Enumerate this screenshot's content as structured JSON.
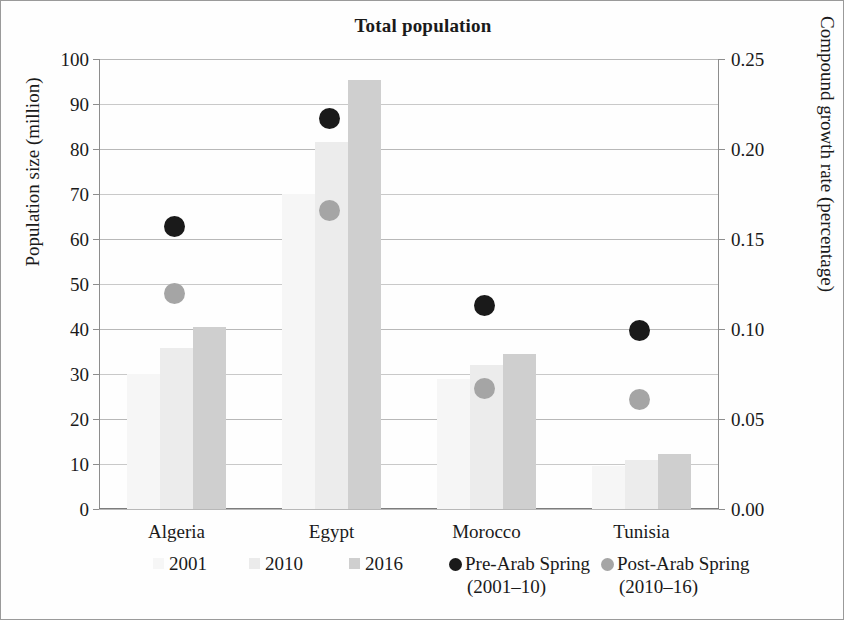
{
  "chart_data": {
    "type": "bar",
    "title": "Total population",
    "categories": [
      "Algeria",
      "Egypt",
      "Morocco",
      "Tunisia"
    ],
    "xlabel": "",
    "ylabel": "Population size (million)",
    "ylabel_right": "Compound growth rate (percentage)",
    "ylim": [
      0,
      100
    ],
    "ylim_right": [
      0.0,
      0.25
    ],
    "yticks": [
      "0",
      "10",
      "20",
      "30",
      "40",
      "50",
      "60",
      "70",
      "80",
      "90",
      "100"
    ],
    "yticks_right": [
      "0.00",
      "0.05",
      "0.10",
      "0.15",
      "0.20",
      "0.25"
    ],
    "grid": true,
    "legend_position": "bottom",
    "series": [
      {
        "name": "2001",
        "kind": "bar",
        "axis": "left",
        "color": "#f6f6f6",
        "values": [
          30.0,
          70.0,
          29.0,
          9.6
        ]
      },
      {
        "name": "2010",
        "kind": "bar",
        "axis": "left",
        "color": "#ececec",
        "values": [
          35.8,
          81.5,
          32.0,
          11.0
        ]
      },
      {
        "name": "2016",
        "kind": "bar",
        "axis": "left",
        "color": "#cfcfcf",
        "values": [
          40.4,
          95.3,
          34.5,
          12.3
        ]
      },
      {
        "name": "Pre-Arab Spring",
        "sublabel": "(2001–10)",
        "kind": "marker",
        "axis": "right",
        "color": "#1a1a1a",
        "values": [
          0.157,
          0.217,
          0.113,
          0.099
        ]
      },
      {
        "name": "Post-Arab Spring",
        "sublabel": "(2010–16)",
        "kind": "marker",
        "axis": "right",
        "color": "#a5a5a5",
        "values": [
          0.12,
          0.166,
          0.067,
          0.061
        ]
      }
    ],
    "legend": [
      {
        "label": "2001",
        "sublabel": "",
        "symbol": "square",
        "color": "#f6f6f6"
      },
      {
        "label": "2010",
        "sublabel": "",
        "symbol": "square",
        "color": "#ebebeb"
      },
      {
        "label": "2016",
        "sublabel": "",
        "symbol": "square",
        "color": "#cfcfcf"
      },
      {
        "label": "Pre-Arab Spring",
        "sublabel": "(2001–10)",
        "symbol": "circle",
        "color": "#1a1a1a"
      },
      {
        "label": "Post-Arab Spring",
        "sublabel": "(2010–16)",
        "symbol": "circle",
        "color": "#a5a5a5"
      }
    ]
  }
}
